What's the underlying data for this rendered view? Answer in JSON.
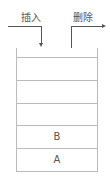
{
  "diagram": {
    "type": "stack",
    "push_label": "插入",
    "pop_label": "删除",
    "slots": [
      "",
      "",
      "",
      "B",
      "A"
    ],
    "colors": {
      "line": "#555555",
      "box": "#bbbbbb"
    }
  }
}
